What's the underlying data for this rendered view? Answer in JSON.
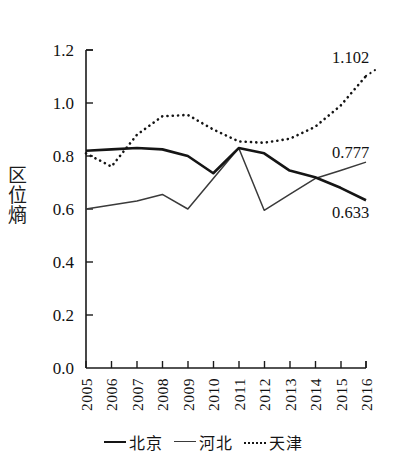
{
  "chart_data": {
    "type": "line",
    "title": "",
    "xlabel": "",
    "ylabel": "区位熵",
    "categories": [
      "2005",
      "2006",
      "2007",
      "2008",
      "2009",
      "2010",
      "2011",
      "2012",
      "2013",
      "2014",
      "2015",
      "2016"
    ],
    "ylim": [
      0.0,
      1.2
    ],
    "yticks": [
      "0.0",
      "0.2",
      "0.4",
      "0.6",
      "0.8",
      "1.0",
      "1.2"
    ],
    "ytick_values": [
      0.0,
      0.2,
      0.4,
      0.6,
      0.8,
      1.0,
      1.2
    ],
    "grid": false,
    "legend_position": "bottom-center",
    "series": [
      {
        "name": "北京",
        "style": "solid-thick",
        "color": "#151515",
        "values": [
          0.82,
          0.825,
          0.83,
          0.825,
          0.8,
          0.735,
          0.83,
          0.81,
          0.745,
          0.72,
          0.68,
          0.633
        ]
      },
      {
        "name": "河北",
        "style": "solid-thin",
        "color": "#3a3a3a",
        "values": [
          0.6,
          0.615,
          0.63,
          0.655,
          0.6,
          0.715,
          0.83,
          0.595,
          0.655,
          0.715,
          0.745,
          0.777
        ]
      },
      {
        "name": "天津",
        "style": "dotted",
        "color": "#151515",
        "values": [
          0.81,
          0.76,
          0.88,
          0.95,
          0.955,
          0.9,
          0.855,
          0.85,
          0.865,
          0.91,
          0.99,
          1.102
        ]
      }
    ],
    "annotations": [
      {
        "text": "1.102",
        "series": "天津",
        "x": "2016",
        "value": 1.102
      },
      {
        "text": "0.777",
        "series": "河北",
        "x": "2016",
        "value": 0.777
      },
      {
        "text": "0.633",
        "series": "北京",
        "x": "2016",
        "value": 0.633
      }
    ]
  },
  "legend": {
    "items": [
      {
        "label": "北京",
        "style": "thick"
      },
      {
        "label": "河北",
        "style": "thin"
      },
      {
        "label": "天津",
        "style": "dotted"
      }
    ]
  },
  "annotations": {
    "tianjin_end": "1.102",
    "hebei_end": "0.777",
    "beijing_end": "0.633"
  },
  "axis": {
    "ylabel": "区位熵",
    "yticks": [
      "1.2",
      "1.0",
      "0.8",
      "0.6",
      "0.4",
      "0.2",
      "0.0"
    ],
    "xticks": [
      "2005",
      "2006",
      "2007",
      "2008",
      "2009",
      "2010",
      "2011",
      "2012",
      "2013",
      "2014",
      "2015",
      "2016"
    ]
  }
}
